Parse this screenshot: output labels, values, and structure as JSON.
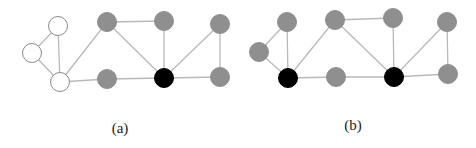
{
  "style": {
    "edge_color": "#b9b9b9",
    "node_radius": 9.5,
    "fill": {
      "white": "#ffffff",
      "gray": "#8f8f8f",
      "black": "#000000"
    },
    "stroke": {
      "white": "#8a8a8a",
      "gray": "#8f8f8f",
      "black": "#000000"
    }
  },
  "figures": [
    {
      "id": "a",
      "caption": "(a)",
      "caption_pos": [
        120,
        128
      ],
      "nodes": [
        {
          "id": "w1",
          "x": 58,
          "y": 26,
          "color": "white"
        },
        {
          "id": "w2",
          "x": 32,
          "y": 53,
          "color": "white"
        },
        {
          "id": "w3",
          "x": 60,
          "y": 82,
          "color": "white"
        },
        {
          "id": "g1",
          "x": 107,
          "y": 22,
          "color": "gray"
        },
        {
          "id": "g2",
          "x": 164,
          "y": 21,
          "color": "gray"
        },
        {
          "id": "g3",
          "x": 220,
          "y": 24,
          "color": "gray"
        },
        {
          "id": "g4",
          "x": 107,
          "y": 79,
          "color": "gray"
        },
        {
          "id": "b1",
          "x": 164,
          "y": 78,
          "color": "black"
        },
        {
          "id": "g5",
          "x": 220,
          "y": 77,
          "color": "gray"
        }
      ],
      "edges": [
        [
          "w1",
          "w2"
        ],
        [
          "w2",
          "w3"
        ],
        [
          "w1",
          "w3"
        ],
        [
          "w3",
          "g1"
        ],
        [
          "w3",
          "g4"
        ],
        [
          "g1",
          "g2"
        ],
        [
          "g1",
          "b1"
        ],
        [
          "g2",
          "b1"
        ],
        [
          "g4",
          "b1"
        ],
        [
          "b1",
          "g5"
        ],
        [
          "b1",
          "g3"
        ],
        [
          "g3",
          "g5"
        ]
      ]
    },
    {
      "id": "b",
      "caption": "(b)",
      "caption_pos": [
        353,
        125
      ],
      "nodes": [
        {
          "id": "h1",
          "x": 287,
          "y": 22,
          "color": "gray"
        },
        {
          "id": "h2",
          "x": 259,
          "y": 52,
          "color": "gray"
        },
        {
          "id": "k1",
          "x": 288,
          "y": 78,
          "color": "black"
        },
        {
          "id": "h3",
          "x": 335,
          "y": 20,
          "color": "gray"
        },
        {
          "id": "h4",
          "x": 393,
          "y": 18,
          "color": "gray"
        },
        {
          "id": "h5",
          "x": 447,
          "y": 22,
          "color": "gray"
        },
        {
          "id": "h6",
          "x": 336,
          "y": 77,
          "color": "gray"
        },
        {
          "id": "k2",
          "x": 394,
          "y": 77,
          "color": "black"
        },
        {
          "id": "h7",
          "x": 448,
          "y": 74,
          "color": "gray"
        }
      ],
      "edges": [
        [
          "h1",
          "h2"
        ],
        [
          "h2",
          "k1"
        ],
        [
          "h1",
          "k1"
        ],
        [
          "k1",
          "h3"
        ],
        [
          "k1",
          "h6"
        ],
        [
          "h3",
          "h4"
        ],
        [
          "h3",
          "k2"
        ],
        [
          "h4",
          "k2"
        ],
        [
          "h6",
          "k2"
        ],
        [
          "k2",
          "h7"
        ],
        [
          "k2",
          "h5"
        ],
        [
          "h5",
          "h7"
        ]
      ]
    }
  ]
}
